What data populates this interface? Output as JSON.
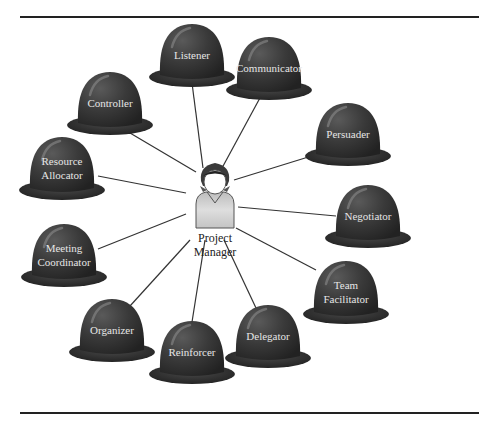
{
  "diagram": {
    "type": "hub-and-spoke",
    "center": {
      "label_lines": [
        "Project",
        "Manager"
      ],
      "icon": "person-icon"
    },
    "roles": [
      {
        "id": "listener",
        "label_lines": [
          "Listener"
        ]
      },
      {
        "id": "communicator",
        "label_lines": [
          "Communicator"
        ]
      },
      {
        "id": "persuader",
        "label_lines": [
          "Persuader"
        ]
      },
      {
        "id": "negotiator",
        "label_lines": [
          "Negotiator"
        ]
      },
      {
        "id": "team-facilitator",
        "label_lines": [
          "Team",
          "Facilitator"
        ]
      },
      {
        "id": "delegator",
        "label_lines": [
          "Delegator"
        ]
      },
      {
        "id": "reinforcer",
        "label_lines": [
          "Reinforcer"
        ]
      },
      {
        "id": "organizer",
        "label_lines": [
          "Organizer"
        ]
      },
      {
        "id": "meeting-coordinator",
        "label_lines": [
          "Meeting",
          "Coordinator"
        ]
      },
      {
        "id": "resource-allocator",
        "label_lines": [
          "Resource",
          "Allocator"
        ]
      },
      {
        "id": "controller",
        "label_lines": [
          "Controller"
        ]
      }
    ],
    "colors": {
      "dome": "#3a3a3a",
      "dome_highlight": "#6a6a6a",
      "brim": "#2e2e2e",
      "label": "#e6e6e6",
      "connector": "#333333",
      "person_shirt": "#cfcfcf",
      "person_hair": "#333333"
    }
  }
}
